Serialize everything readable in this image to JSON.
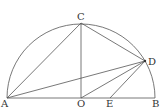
{
  "diagram": {
    "type": "geometry-semicircle",
    "points": {
      "A": {
        "label": "A",
        "x": 7,
        "y": 98
      },
      "B": {
        "label": "B",
        "x": 155,
        "y": 98
      },
      "O": {
        "label": "O",
        "x": 81,
        "y": 98
      },
      "C": {
        "label": "C",
        "x": 81,
        "y": 23
      },
      "D": {
        "label": "D",
        "x": 145,
        "y": 61
      },
      "E": {
        "label": "E",
        "x": 110,
        "y": 98
      }
    },
    "segments": [
      "AB",
      "AC",
      "CO",
      "CD",
      "AD",
      "OD",
      "ED",
      "BD"
    ],
    "arc": "semicircle with diameter AB, center O",
    "line_color": "#555555"
  }
}
